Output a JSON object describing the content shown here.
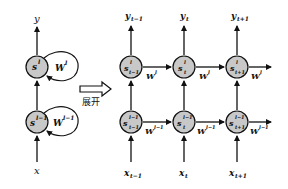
{
  "diagram": {
    "colors": {
      "node_fill": "#c8c8c8",
      "stroke": "#111111",
      "background": "#ffffff"
    },
    "folded": {
      "output": "y",
      "input": "x",
      "nodes": [
        {
          "id": "s_l",
          "base": "s",
          "sup": "l",
          "recurrent_weight": {
            "base": "W",
            "sup": "l"
          }
        },
        {
          "id": "s_l-1",
          "base": "s",
          "sup": "l−1",
          "recurrent_weight": {
            "base": "W",
            "sup": "l−1"
          }
        }
      ]
    },
    "unfold_arrow": {
      "label": "展开"
    },
    "unfolded": {
      "timesteps": [
        {
          "sub": "t−1",
          "output": {
            "base": "y",
            "sub": "t−1"
          },
          "input": {
            "base": "x",
            "sub": "t−1"
          },
          "upper": {
            "base": "s",
            "sup": "l",
            "sub": "t−1"
          },
          "lower": {
            "base": "s",
            "sup": "l−1",
            "sub": "t−1"
          }
        },
        {
          "sub": "t",
          "output": {
            "base": "y",
            "sub": "t"
          },
          "input": {
            "base": "x",
            "sub": "t"
          },
          "upper": {
            "base": "s",
            "sup": "l",
            "sub": "t"
          },
          "lower": {
            "base": "s",
            "sup": "l−1",
            "sub": "t"
          }
        },
        {
          "sub": "t+1",
          "output": {
            "base": "y",
            "sub": "t+1"
          },
          "input": {
            "base": "x",
            "sub": "t+1"
          },
          "upper": {
            "base": "s",
            "sup": "l",
            "sub": "t+1"
          },
          "lower": {
            "base": "s",
            "sup": "l−1",
            "sub": "t+1"
          }
        }
      ],
      "upper_edge_weight": {
        "base": "W",
        "sup": "l"
      },
      "lower_edge_weight": {
        "base": "W",
        "sup": "l−1"
      }
    }
  }
}
